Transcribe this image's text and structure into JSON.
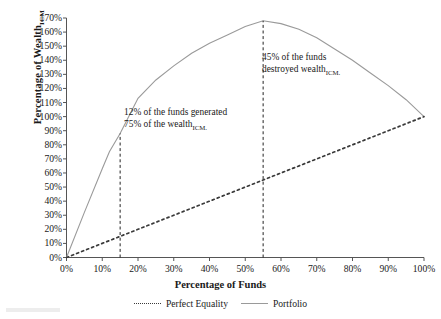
{
  "chart_data": {
    "type": "line",
    "title": "",
    "xlabel": "Percentage of Funds",
    "ylabel": "Percentage of Wealth",
    "ylabel_subscript": "ICM",
    "xlim": [
      0,
      100
    ],
    "ylim": [
      0,
      170
    ],
    "grid": false,
    "legend_position": "bottom",
    "x_ticks": [
      "0%",
      "10%",
      "20%",
      "30%",
      "40%",
      "50%",
      "60%",
      "70%",
      "80%",
      "90%",
      "100%"
    ],
    "y_ticks": [
      "0%",
      "10%",
      "20%",
      "30%",
      "40%",
      "50%",
      "60%",
      "70%",
      "80%",
      "90%",
      "100%",
      "110%",
      "120%",
      "130%",
      "140%",
      "150%",
      "160%",
      "170%"
    ],
    "series": [
      {
        "name": "Perfect Equality",
        "style": "dotted",
        "color": "#3a3a3a",
        "x": [
          0,
          10,
          20,
          30,
          40,
          50,
          55,
          60,
          70,
          80,
          90,
          100
        ],
        "values": [
          0,
          10,
          20,
          30,
          40,
          50,
          55,
          60,
          70,
          80,
          90,
          100
        ]
      },
      {
        "name": "Portfolio",
        "style": "solid",
        "color": "#9a9a9a",
        "x": [
          0,
          5,
          10,
          12,
          15,
          20,
          25,
          30,
          35,
          40,
          45,
          50,
          55,
          60,
          65,
          70,
          75,
          80,
          85,
          90,
          95,
          100
        ],
        "values": [
          0,
          32,
          63,
          75,
          88,
          113,
          126,
          136,
          145,
          152,
          158,
          164,
          168,
          166,
          162,
          156,
          148,
          140,
          131,
          122,
          112,
          100
        ]
      }
    ],
    "annotations": [
      {
        "name": "funds-generated-annotation",
        "line1": "12% of the funds generated",
        "line2_prefix": "75% of the wealth",
        "line2_subscript": "ICM.",
        "marker_x_percent": 15
      },
      {
        "name": "wealth-destroyed-annotation",
        "line1": "45% of the funds",
        "line2_prefix": "destroyed wealth",
        "line2_subscript": "ICM.",
        "marker_x_percent": 55
      }
    ],
    "reference_lines": [
      {
        "name": "vline-15",
        "x_percent": 15,
        "y_top_percent": 88,
        "style": "dashed"
      },
      {
        "name": "vline-55",
        "x_percent": 55,
        "y_top_percent": 168,
        "style": "dashed"
      }
    ]
  },
  "legend": {
    "items": [
      {
        "label": "Perfect Equality",
        "style": "dotted"
      },
      {
        "label": "Portfolio",
        "style": "solid"
      }
    ]
  }
}
